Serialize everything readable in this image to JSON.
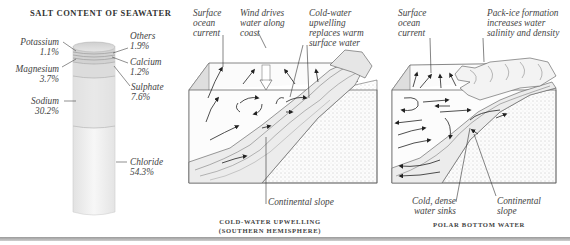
{
  "panel_salt": {
    "title": "SALT CONTENT OF SEAWATER",
    "components": [
      {
        "name": "Potassium",
        "pct": "1.1%",
        "side": "left"
      },
      {
        "name": "Magnesium",
        "pct": "3.7%",
        "side": "left"
      },
      {
        "name": "Sodium",
        "pct": "30.2%",
        "side": "left"
      },
      {
        "name": "Others",
        "pct": "1.9%",
        "side": "right"
      },
      {
        "name": "Calcium",
        "pct": "1.2%",
        "side": "right"
      },
      {
        "name": "Sulphate",
        "pct": "7.6%",
        "side": "right"
      },
      {
        "name": "Chloride",
        "pct": "54.3%",
        "side": "right"
      }
    ]
  },
  "panel_upwelling": {
    "labels": {
      "surface_current": [
        "Surface",
        "ocean",
        "current"
      ],
      "wind": [
        "Wind drives",
        "water along",
        "coast"
      ],
      "cold_water": [
        "Cold-water",
        "upwelling",
        "replaces warm",
        "surface water"
      ],
      "slope": "Continental slope"
    },
    "caption": [
      "COLD-WATER UPWELLING",
      "(SOUTHERN HEMISPHERE)"
    ]
  },
  "panel_polar": {
    "labels": {
      "surface_current": [
        "Surface",
        "ocean",
        "current"
      ],
      "pack_ice": [
        "Pack-ice formation",
        "increases water",
        "salinity and density"
      ],
      "cold_dense": [
        "Cold, dense",
        "water sinks"
      ],
      "slope": [
        "Continental",
        "slope"
      ]
    },
    "caption": "POLAR BOTTOM WATER"
  },
  "colors": {
    "text": "#444444",
    "line": "#333333",
    "cylinder_top": "#c8c8c8",
    "cylinder_body": "#f2f2f2",
    "rule": "#9a9a9a"
  }
}
